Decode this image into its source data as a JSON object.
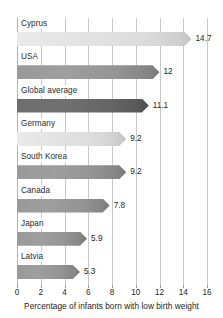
{
  "chart_data": {
    "type": "bar",
    "orientation": "horizontal",
    "title": "",
    "subtitle": "",
    "xlabel": "Percentage of infants born with low birth weight",
    "ylabel": "",
    "xlim": [
      0,
      16
    ],
    "xticks": [
      0,
      2,
      4,
      6,
      8,
      10,
      12,
      14,
      16
    ],
    "xtick_labels": [
      "0",
      "2",
      "4",
      "6",
      "8",
      "10",
      "12",
      "14",
      "16"
    ],
    "grid": true,
    "legend": "none",
    "categories": [
      "Cyprus",
      "USA",
      "Global average",
      "Germany",
      "South Korea",
      "Canada",
      "Japan",
      "Latvia"
    ],
    "values": [
      14.7,
      12,
      11.1,
      9.2,
      9.2,
      7.8,
      5.9,
      5.3
    ],
    "value_labels": [
      "14.7",
      "12",
      "11.1",
      "9.2",
      "9.2",
      "7.8",
      "5.9",
      "5.3"
    ],
    "bar_styles": [
      "light",
      "dark",
      "darkest",
      "light",
      "dark",
      "dark",
      "dark",
      "dark"
    ],
    "bars": [
      {
        "category": "Cyprus",
        "value": 14.7,
        "label": "14.7",
        "style": "light"
      },
      {
        "category": "USA",
        "value": 12,
        "label": "12",
        "style": "dark"
      },
      {
        "category": "Global average",
        "value": 11.1,
        "label": "11.1",
        "style": "darkest"
      },
      {
        "category": "Germany",
        "value": 9.2,
        "label": "9.2",
        "style": "light"
      },
      {
        "category": "South Korea",
        "value": 9.2,
        "label": "9.2",
        "style": "dark"
      },
      {
        "category": "Canada",
        "value": 7.8,
        "label": "7.8",
        "style": "dark"
      },
      {
        "category": "Japan",
        "value": 5.9,
        "label": "5.9",
        "style": "dark"
      },
      {
        "category": "Latvia",
        "value": 5.3,
        "label": "5.3",
        "style": "dark"
      }
    ],
    "colors": {
      "background": "#ffffff",
      "gridline": "#c9c9c9",
      "text": "#1e1e1e",
      "bar_light": "#e2e2e2",
      "bar_dark": "#949494",
      "bar_darkest": "#656565"
    }
  }
}
